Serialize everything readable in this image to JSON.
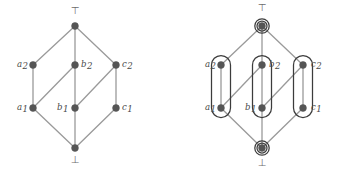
{
  "figure": {
    "colors": {
      "node_fill": "#555555",
      "node_stroke": "#555555",
      "edge": "#9a9a9a",
      "label": "#4a4a4a",
      "grouping_stroke": "#3c3c3c",
      "background": "#ffffff"
    },
    "geometry": {
      "node_radius": 3.4,
      "edge_width": 1.3,
      "group_stroke_width": 1.25,
      "top_ring_outer_radius": 7.2,
      "top_ring_inner_radius": 5.0
    }
  },
  "diagrams": [
    {
      "id": "plain-lattice",
      "name": "plain-hasse-diagram",
      "origin_x": 0,
      "nodes": [
        {
          "id": "top",
          "label": "⊤",
          "label_kind": "symbol",
          "x": 75,
          "y": 26,
          "label_x": 75,
          "label_y": 14,
          "grouped": false
        },
        {
          "id": "a2",
          "label": "a",
          "sub": "2",
          "label_kind": "italic",
          "x": 33,
          "y": 65,
          "label_x": 17,
          "label_y": 67,
          "grouped": true
        },
        {
          "id": "b2",
          "label": "b",
          "sub": "2",
          "label_kind": "italic",
          "x": 75,
          "y": 65,
          "label_x": 81,
          "label_y": 67,
          "grouped": true
        },
        {
          "id": "c2",
          "label": "c",
          "sub": "2",
          "label_kind": "italic",
          "x": 116,
          "y": 65,
          "label_x": 122,
          "label_y": 67,
          "grouped": true
        },
        {
          "id": "a1",
          "label": "a",
          "sub": "1",
          "label_kind": "italic",
          "x": 33,
          "y": 108,
          "label_x": 17,
          "label_y": 110,
          "grouped": true
        },
        {
          "id": "b1",
          "label": "b",
          "sub": "1",
          "label_kind": "italic",
          "x": 75,
          "y": 108,
          "label_x": 57,
          "label_y": 110,
          "grouped": true
        },
        {
          "id": "c1",
          "label": "c",
          "sub": "1",
          "label_kind": "italic",
          "x": 116,
          "y": 108,
          "label_x": 122,
          "label_y": 110,
          "grouped": true
        },
        {
          "id": "bot",
          "label": "⊥",
          "label_kind": "symbol",
          "x": 75,
          "y": 148,
          "label_x": 75,
          "label_y": 163,
          "grouped": false
        }
      ],
      "edges": [
        {
          "from": "a2",
          "to": "top"
        },
        {
          "from": "b2",
          "to": "top"
        },
        {
          "from": "c2",
          "to": "top"
        },
        {
          "from": "a1",
          "to": "a2"
        },
        {
          "from": "b1",
          "to": "b2"
        },
        {
          "from": "c1",
          "to": "c2"
        },
        {
          "from": "a1",
          "to": "b2"
        },
        {
          "from": "b1",
          "to": "c2"
        },
        {
          "from": "bot",
          "to": "a1"
        },
        {
          "from": "bot",
          "to": "b1"
        },
        {
          "from": "bot",
          "to": "c1"
        }
      ],
      "groups": []
    },
    {
      "id": "grouped-lattice",
      "name": "grouped-hasse-diagram",
      "origin_x": 177,
      "nodes": [
        {
          "id": "top",
          "label": "⊤",
          "label_kind": "symbol",
          "x": 262,
          "y": 26,
          "label_x": 262,
          "label_y": 11,
          "grouped": false
        },
        {
          "id": "a2",
          "label": "a",
          "sub": "2",
          "label_kind": "italic",
          "x": 221,
          "y": 65,
          "label_x": 205,
          "label_y": 67,
          "grouped": true
        },
        {
          "id": "b2",
          "label": "b",
          "sub": "2",
          "label_kind": "italic",
          "x": 262,
          "y": 65,
          "label_x": 269,
          "label_y": 67,
          "grouped": true
        },
        {
          "id": "c2",
          "label": "c",
          "sub": "2",
          "label_kind": "italic",
          "x": 303,
          "y": 65,
          "label_x": 311,
          "label_y": 67,
          "grouped": true
        },
        {
          "id": "a1",
          "label": "a",
          "sub": "1",
          "label_kind": "italic",
          "x": 221,
          "y": 108,
          "label_x": 205,
          "label_y": 110,
          "grouped": true
        },
        {
          "id": "b1",
          "label": "b",
          "sub": "1",
          "label_kind": "italic",
          "x": 262,
          "y": 108,
          "label_x": 245,
          "label_y": 110,
          "grouped": true
        },
        {
          "id": "c1",
          "label": "c",
          "sub": "1",
          "label_kind": "italic",
          "x": 303,
          "y": 108,
          "label_x": 311,
          "label_y": 110,
          "grouped": true
        },
        {
          "id": "bot",
          "label": "⊥",
          "label_kind": "symbol",
          "x": 262,
          "y": 148,
          "label_x": 262,
          "label_y": 166,
          "grouped": false
        }
      ],
      "edges": [
        {
          "from": "a2",
          "to": "top"
        },
        {
          "from": "b2",
          "to": "top"
        },
        {
          "from": "c2",
          "to": "top"
        },
        {
          "from": "a1",
          "to": "a2"
        },
        {
          "from": "b1",
          "to": "b2"
        },
        {
          "from": "c1",
          "to": "c2"
        },
        {
          "from": "a1",
          "to": "b2"
        },
        {
          "from": "b1",
          "to": "c2"
        },
        {
          "from": "bot",
          "to": "a1"
        },
        {
          "from": "bot",
          "to": "b1"
        },
        {
          "from": "bot",
          "to": "c1"
        }
      ],
      "groups": [
        {
          "id": "group-top",
          "kind": "ring",
          "members": [
            "top"
          ],
          "cx": 262,
          "cy": 26
        },
        {
          "id": "group-a",
          "kind": "stadium",
          "members": [
            "a1",
            "a2"
          ],
          "cx": 221,
          "y_top": 65,
          "y_bottom": 108,
          "rx": 9.5
        },
        {
          "id": "group-b",
          "kind": "stadium",
          "members": [
            "b1",
            "b2"
          ],
          "cx": 262,
          "y_top": 65,
          "y_bottom": 108,
          "rx": 9.5
        },
        {
          "id": "group-c",
          "kind": "stadium",
          "members": [
            "c1",
            "c2"
          ],
          "cx": 303,
          "y_top": 65,
          "y_bottom": 108,
          "rx": 9.5
        },
        {
          "id": "group-bot",
          "kind": "ring",
          "members": [
            "bot"
          ],
          "cx": 262,
          "cy": 148
        }
      ]
    }
  ]
}
